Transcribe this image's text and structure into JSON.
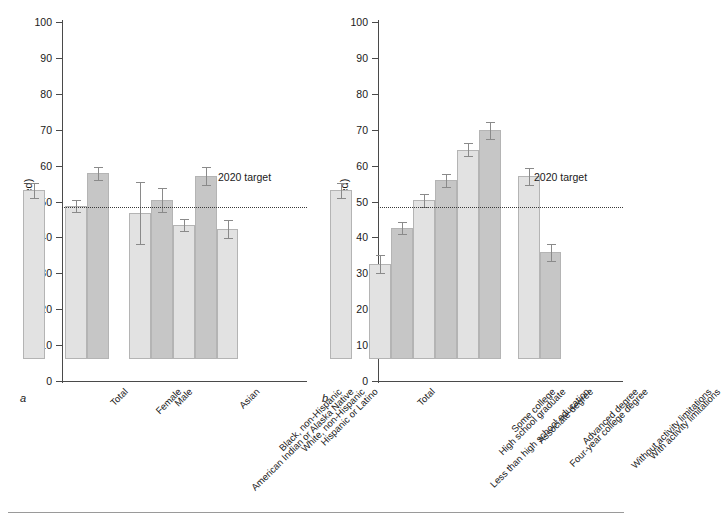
{
  "figure": {
    "axis_label": "Percent (age adjusted)",
    "target_label": "2020 target",
    "target_value": 48.5,
    "y_ticks": [
      0,
      10,
      20,
      30,
      40,
      50,
      60,
      70,
      80,
      90,
      100
    ],
    "panel_a_letter": "a",
    "panel_b_letter": "b",
    "bar_light_color": "#e2e2e2",
    "bar_dark_color": "#c6c6c6",
    "error_bar_color": "#8a8a8a"
  },
  "chart_data": [
    {
      "type": "bar",
      "panel": "a",
      "title": "",
      "xlabel": "",
      "ylabel": "Percent (age adjusted)",
      "ylim": [
        0,
        100
      ],
      "grid": false,
      "legend": "none",
      "annotations": [
        {
          "text": "2020 target",
          "value": 48.5,
          "style": "dotted-line"
        }
      ],
      "categories": [
        "Total",
        "Female",
        "Male",
        "American Indian or Alaska Native",
        "Asian",
        "Black, non-Hispanic",
        "White, non-Hispanic",
        "Hispanic or Latino"
      ],
      "values": [
        47.0,
        42.5,
        51.7,
        40.6,
        44.2,
        37.3,
        51.0,
        36.1
      ],
      "error_low": [
        44.8,
        40.9,
        49.8,
        32.1,
        40.9,
        35.6,
        48.5,
        33.6
      ],
      "error_high": [
        49.1,
        44.2,
        53.6,
        49.2,
        47.6,
        39.1,
        53.6,
        38.6
      ],
      "shades": [
        "light",
        "light",
        "dark",
        "light",
        "dark",
        "light",
        "dark",
        "light"
      ],
      "groups": [
        {
          "name": "overall",
          "indices": [
            0
          ]
        },
        {
          "name": "sex",
          "indices": [
            1,
            2
          ]
        },
        {
          "name": "race-ethnicity",
          "indices": [
            3,
            4,
            5,
            6,
            7
          ]
        }
      ]
    },
    {
      "type": "bar",
      "panel": "b",
      "title": "",
      "xlabel": "",
      "ylabel": "Percent (age adjusted)",
      "ylim": [
        0,
        100
      ],
      "grid": false,
      "legend": "none",
      "annotations": [
        {
          "text": "2020 target",
          "value": 48.5,
          "style": "dotted-line"
        }
      ],
      "categories": [
        "Total",
        "Less than high school education",
        "High school graduate",
        "Some college",
        "Associate degree",
        "Four-year college degree",
        "Advanced degree",
        "Without activity limitations",
        "With activity limitations"
      ],
      "values": [
        47.0,
        26.4,
        36.5,
        44.2,
        49.8,
        58.3,
        63.7,
        51.0,
        29.7
      ],
      "error_low": [
        44.8,
        23.9,
        34.9,
        42.4,
        47.9,
        56.5,
        61.4,
        48.6,
        27.2
      ],
      "error_high": [
        49.1,
        28.9,
        38.1,
        46.1,
        51.6,
        60.2,
        65.9,
        53.2,
        32.1
      ],
      "shades": [
        "light",
        "light",
        "dark",
        "light",
        "dark",
        "light",
        "dark",
        "light",
        "dark"
      ],
      "groups": [
        {
          "name": "overall",
          "indices": [
            0
          ]
        },
        {
          "name": "education",
          "indices": [
            1,
            2,
            3,
            4,
            5,
            6
          ]
        },
        {
          "name": "activity-limitation",
          "indices": [
            7,
            8
          ]
        }
      ]
    }
  ]
}
